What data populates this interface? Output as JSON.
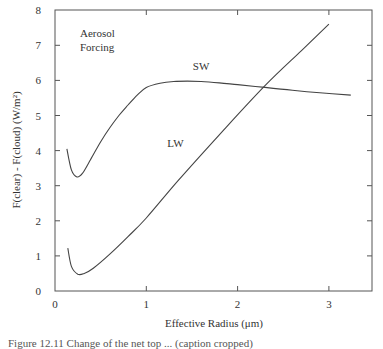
{
  "chart_data": {
    "type": "line",
    "title": "",
    "annotation": "Aerosol\nForcing",
    "annotation_lines": [
      "Aerosol",
      "Forcing"
    ],
    "xlabel": "Effective Radius (μm)",
    "ylabel": "F(clear) - F(cloud) (W/m²)",
    "xlim": [
      0,
      3.47
    ],
    "ylim": [
      0,
      8
    ],
    "xticks": [
      0,
      1,
      2,
      3
    ],
    "yticks": [
      0,
      1,
      2,
      3,
      4,
      5,
      6,
      7,
      8
    ],
    "grid": false,
    "legend": "inline labels",
    "series": [
      {
        "name": "SW",
        "label_pos": [
          1.6,
          6.3
        ],
        "x": [
          0.13,
          0.18,
          0.24,
          0.3,
          0.38,
          0.5,
          0.6,
          0.7,
          0.8,
          0.9,
          1.0,
          1.15,
          1.3,
          1.45,
          1.6,
          1.8,
          2.0,
          2.3,
          2.6,
          2.9,
          3.24
        ],
        "values": [
          4.05,
          3.45,
          3.25,
          3.35,
          3.7,
          4.25,
          4.65,
          5.0,
          5.3,
          5.58,
          5.8,
          5.92,
          5.97,
          5.98,
          5.97,
          5.93,
          5.88,
          5.8,
          5.72,
          5.65,
          5.58
        ]
      },
      {
        "name": "LW",
        "label_pos": [
          1.32,
          4.1
        ],
        "x": [
          0.14,
          0.18,
          0.25,
          0.32,
          0.42,
          0.6,
          0.8,
          1.0,
          1.35,
          1.8,
          2.3,
          2.7,
          3.0
        ],
        "values": [
          1.22,
          0.7,
          0.48,
          0.5,
          0.65,
          1.05,
          1.55,
          2.08,
          3.15,
          4.45,
          5.85,
          6.85,
          7.6
        ]
      }
    ]
  },
  "caption": {
    "text": "Figure 12.11 Change of the net top ... (caption cropped)"
  }
}
